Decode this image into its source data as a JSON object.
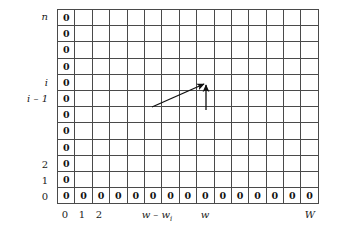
{
  "figure": {
    "kind": "dp-table-diagram",
    "title": "",
    "colors": {
      "grid_line": "#4a4a4a",
      "text": "#1a1a1a",
      "arrow": "#111111",
      "background": "#ffffff"
    }
  },
  "grid": {
    "columns": 15,
    "rows": 12,
    "filled_value": "0",
    "first_column_all_zero": true,
    "bottom_row_all_zero": true,
    "rows_data": [
      [
        "0",
        "",
        "",
        "",
        "",
        "",
        "",
        "",
        "",
        "",
        "",
        "",
        "",
        "",
        ""
      ],
      [
        "0",
        "",
        "",
        "",
        "",
        "",
        "",
        "",
        "",
        "",
        "",
        "",
        "",
        "",
        ""
      ],
      [
        "0",
        "",
        "",
        "",
        "",
        "",
        "",
        "",
        "",
        "",
        "",
        "",
        "",
        "",
        ""
      ],
      [
        "0",
        "",
        "",
        "",
        "",
        "",
        "",
        "",
        "",
        "",
        "",
        "",
        "",
        "",
        ""
      ],
      [
        "0",
        "",
        "",
        "",
        "",
        "",
        "",
        "",
        "",
        "",
        "",
        "",
        "",
        "",
        ""
      ],
      [
        "0",
        "",
        "",
        "",
        "",
        "",
        "",
        "",
        "",
        "",
        "",
        "",
        "",
        "",
        ""
      ],
      [
        "0",
        "",
        "",
        "",
        "",
        "",
        "",
        "",
        "",
        "",
        "",
        "",
        "",
        "",
        ""
      ],
      [
        "0",
        "",
        "",
        "",
        "",
        "",
        "",
        "",
        "",
        "",
        "",
        "",
        "",
        "",
        ""
      ],
      [
        "0",
        "",
        "",
        "",
        "",
        "",
        "",
        "",
        "",
        "",
        "",
        "",
        "",
        "",
        ""
      ],
      [
        "0",
        "",
        "",
        "",
        "",
        "",
        "",
        "",
        "",
        "",
        "",
        "",
        "",
        "",
        ""
      ],
      [
        "0",
        "",
        "",
        "",
        "",
        "",
        "",
        "",
        "",
        "",
        "",
        "",
        "",
        "",
        ""
      ],
      [
        "0",
        "0",
        "0",
        "0",
        "0",
        "0",
        "0",
        "0",
        "0",
        "0",
        "0",
        "0",
        "0",
        "0",
        "0"
      ]
    ]
  },
  "row_labels": [
    {
      "text": "n",
      "italic": true
    },
    {
      "text": "",
      "italic": true
    },
    {
      "text": "",
      "italic": true
    },
    {
      "text": "",
      "italic": true
    },
    {
      "text": "i",
      "italic": true
    },
    {
      "text": "i – 1",
      "italic": true
    },
    {
      "text": "",
      "italic": true
    },
    {
      "text": "",
      "italic": true
    },
    {
      "text": "",
      "italic": true
    },
    {
      "text": "2",
      "italic": false
    },
    {
      "text": "1",
      "italic": false
    },
    {
      "text": "0",
      "italic": false
    }
  ],
  "column_labels": [
    {
      "text": "0",
      "italic": false,
      "x": 8
    },
    {
      "text": "1",
      "italic": false,
      "x": 25
    },
    {
      "text": "2",
      "italic": false,
      "x": 42
    },
    {
      "text": "w – w",
      "sub": "i",
      "italic": true,
      "x": 100
    },
    {
      "text": "w",
      "italic": true,
      "x": 148
    },
    {
      "text": "W",
      "italic": true,
      "x": 253
    }
  ],
  "arrows": [
    {
      "name": "diagonal-arrow",
      "description": "long diagonal arrow pointing up-right from cell (w - w_i, i - 1) toward cell (w, i)",
      "x1": 152,
      "y1": 107,
      "x2": 204,
      "y2": 84
    },
    {
      "name": "vertical-arrow",
      "description": "short vertical arrow pointing up from row i - 1 into row i at column w",
      "x1": 206,
      "y1": 110,
      "x2": 206,
      "y2": 85
    }
  ]
}
